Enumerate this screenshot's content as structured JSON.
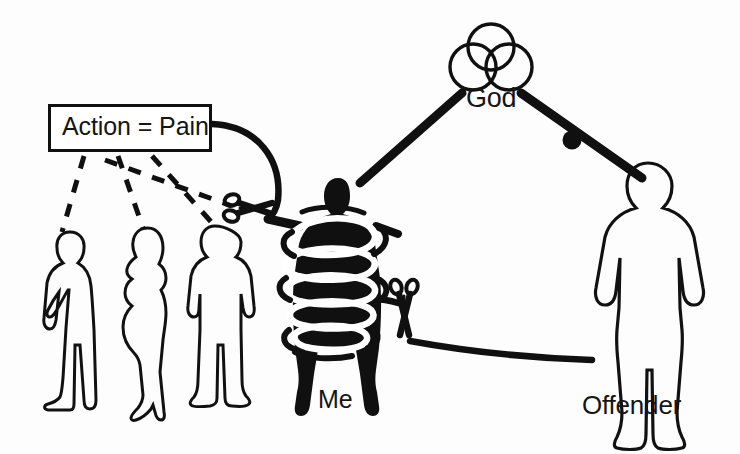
{
  "diagram": {
    "background_color": "#fdfdfd",
    "ink_color": "#101010",
    "labels": {
      "god": "God",
      "me": "Me",
      "offender": "Offender",
      "action_pain": "Action = Pain"
    },
    "nodes": [
      {
        "id": "god",
        "label": "God",
        "icon": "trinity-three-circles-icon",
        "kind": "symbol",
        "x": 492,
        "y": 58
      },
      {
        "id": "me",
        "label": "Me",
        "icon": "bound-person-silhouette-icon",
        "kind": "filled-silhouette",
        "x": 338,
        "y": 290,
        "state": "bound-with-rope"
      },
      {
        "id": "offender",
        "label": "Offender",
        "icon": "person-outline-icon",
        "kind": "outline-silhouette",
        "x": 648,
        "y": 285
      },
      {
        "id": "bystander-1",
        "label": "",
        "icon": "person-outline-icon",
        "kind": "outline-silhouette",
        "x": 76,
        "y": 310
      },
      {
        "id": "bystander-2",
        "label": "",
        "icon": "woman-outline-icon",
        "kind": "outline-silhouette",
        "x": 148,
        "y": 320
      },
      {
        "id": "bystander-3",
        "label": "",
        "icon": "person-outline-icon",
        "kind": "outline-silhouette",
        "x": 218,
        "y": 315
      }
    ],
    "connections": [
      {
        "id": "god-to-me",
        "from": "god",
        "to": "me",
        "style": "thick-solid",
        "marker": "none"
      },
      {
        "id": "god-to-offender",
        "from": "god",
        "to": "offender",
        "style": "thick-solid",
        "marker": "knot"
      },
      {
        "id": "action-to-me",
        "from": "action_pain",
        "to": "me",
        "style": "thick-curve",
        "marker": "scissors-horizontal"
      },
      {
        "id": "me-to-offender",
        "from": "me",
        "to": "offender",
        "style": "thick-curve",
        "marker": "scissors-vertical"
      },
      {
        "id": "action-to-bystander-1",
        "from": "action_pain",
        "to": "bystander-1",
        "style": "dashed",
        "marker": "none"
      },
      {
        "id": "action-to-bystander-2",
        "from": "action_pain",
        "to": "bystander-2",
        "style": "dashed",
        "marker": "none"
      },
      {
        "id": "action-to-bystander-3",
        "from": "action_pain",
        "to": "bystander-3",
        "style": "dashed",
        "marker": "none"
      },
      {
        "id": "action-cross-dashed",
        "from": "action_pain",
        "to": "scissors-horizontal",
        "style": "dashed",
        "marker": "none"
      }
    ]
  }
}
